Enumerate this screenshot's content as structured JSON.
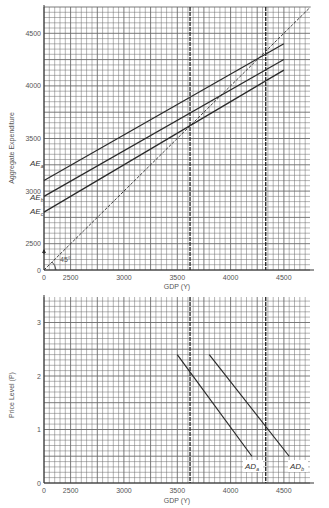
{
  "chart_data": [
    {
      "type": "line",
      "title": "",
      "xlabel": "GDP (Y)",
      "ylabel": "Aggregate Expenditure",
      "x_ticks": [
        "0",
        "2500",
        "3000",
        "3500",
        "4000",
        "4500"
      ],
      "y_ticks": [
        "0",
        "2500",
        "3000",
        "3500",
        "4000",
        "4500"
      ],
      "xlim": [
        2250,
        4750
      ],
      "ylim": [
        2250,
        4750
      ],
      "grid": true,
      "axis_break": "0 at origin, broken scale to 2500",
      "series": [
        {
          "name": "AE_a",
          "x": [
            0,
            4500
          ],
          "y": [
            3100,
            4400
          ]
        },
        {
          "name": "AE_b",
          "x": [
            0,
            4500
          ],
          "y": [
            2950,
            4250
          ]
        },
        {
          "name": "AE_c",
          "x": [
            0,
            4500
          ],
          "y": [
            2800,
            4150
          ]
        },
        {
          "name": "45° line",
          "x": [
            0,
            4750
          ],
          "y": [
            0,
            4750
          ]
        }
      ],
      "annotations": [
        "45°",
        "AE_a",
        "AE_b",
        "AE_c"
      ],
      "dashed_verticals": [
        3620,
        4330
      ]
    },
    {
      "type": "line",
      "title": "",
      "xlabel": "GDP (Y)",
      "ylabel": "Price Level (P)",
      "x_ticks": [
        "0",
        "2500",
        "3000",
        "3500",
        "4000",
        "4500"
      ],
      "y_ticks": [
        "0",
        "1",
        "2",
        "3"
      ],
      "xlim": [
        2250,
        4750
      ],
      "ylim": [
        0,
        3.5
      ],
      "grid": true,
      "series": [
        {
          "name": "AD_a",
          "x": [
            3500,
            4200
          ],
          "y": [
            2.4,
            0.5
          ]
        },
        {
          "name": "AD_b",
          "x": [
            3800,
            4550
          ],
          "y": [
            2.4,
            0.5
          ]
        }
      ],
      "annotations": [
        "AD_a",
        "AD_b"
      ],
      "dashed_verticals": [
        3620,
        4330
      ]
    }
  ],
  "top": {
    "ylabel": "Aggregate Expenditure",
    "xlabel": "GDP (Y)",
    "angle_label": "45°",
    "curves": [
      {
        "main": "AE",
        "sub": "a"
      },
      {
        "main": "AE",
        "sub": "b"
      },
      {
        "main": "AE",
        "sub": "c"
      }
    ]
  },
  "bottom": {
    "ylabel": "Price Level (P)",
    "xlabel": "GDP (Y)",
    "curves": [
      {
        "main": "AD",
        "sub": "a"
      },
      {
        "main": "AD",
        "sub": "b"
      }
    ]
  },
  "colors": {
    "grid": "#6b6b6b",
    "line": "#2a2a2a",
    "text": "#555555"
  }
}
